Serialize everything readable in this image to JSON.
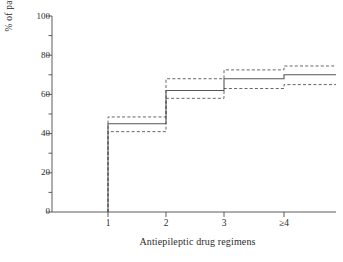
{
  "chart_data": {
    "type": "line",
    "title": "",
    "xlabel": "Antiepileptic drug regimens",
    "ylabel": "% of patients",
    "categories": [
      "1",
      "2",
      "3",
      "≥4"
    ],
    "xtick_labels": [
      "1",
      "2",
      "3",
      "≥4"
    ],
    "ytick_labels": [
      "0",
      "20",
      "40",
      "60",
      "80",
      "100"
    ],
    "ytick_values": [
      0,
      20,
      40,
      60,
      80,
      100
    ],
    "yminor_values": [
      10,
      30,
      50,
      70,
      90
    ],
    "ylim": [
      0,
      100
    ],
    "grid": false,
    "legend": "none",
    "step_style": "post",
    "series": [
      {
        "name": "Cumulative % seizure-free",
        "style": "solid",
        "color": "#555555",
        "values": [
          45,
          62,
          68,
          70
        ]
      },
      {
        "name": "Upper 95% confidence limit",
        "style": "dashed",
        "color": "#555555",
        "values": [
          48.5,
          68,
          72.5,
          74.5
        ]
      },
      {
        "name": "Lower 95% confidence limit",
        "style": "dashed",
        "color": "#555555",
        "values": [
          41,
          58,
          63,
          65
        ]
      }
    ]
  },
  "axes": {
    "y_axis_name": "percent-of-patients-axis",
    "x_axis_name": "drug-regimens-axis"
  }
}
